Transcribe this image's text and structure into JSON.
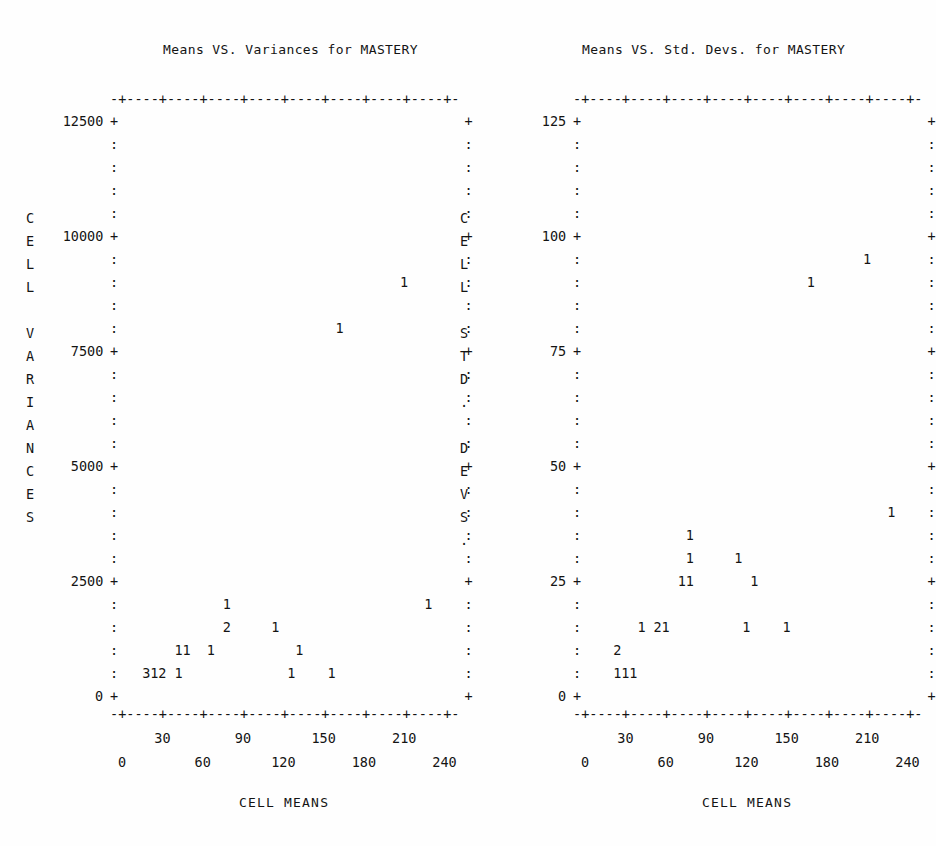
{
  "page": {
    "background": "#fefefe",
    "ink": "#141414",
    "width": 934,
    "height": 846
  },
  "panels": [
    {
      "id": "variances",
      "title": "Means VS. Variances for MASTERY",
      "y_axis_label": "CELL VARIANCES",
      "y_axis_label_chars": [
        "C",
        "E",
        "L",
        "L",
        "",
        "V",
        "A",
        "R",
        "I",
        "A",
        "N",
        "C",
        "E",
        "S"
      ],
      "x_axis_label": "CELL MEANS",
      "y_ticks": [
        "12500",
        "10000",
        "7500",
        "5000",
        "2500",
        "0"
      ],
      "x_ticks_upper": [
        "30",
        "90",
        "150",
        "210"
      ],
      "x_ticks_lower": [
        "0",
        "60",
        "120",
        "180",
        "240"
      ],
      "frame_top": "-+----+----+----+----+----+----+----+----+-",
      "frame_bottom": "-+----+----+----+----+----+----+----+----+-",
      "axis_col_symbol_major": "+",
      "axis_col_symbol_minor": ":"
    },
    {
      "id": "stddevs",
      "title": "Means VS. Std. Devs. for MASTERY",
      "y_axis_label": "CELL STD. DEVS.",
      "y_axis_label_chars": [
        "C",
        "E",
        "L",
        "L",
        "",
        "S",
        "T",
        "D",
        ".",
        "",
        "D",
        "E",
        "V",
        "S",
        "."
      ],
      "x_axis_label": "CELL MEANS",
      "y_ticks": [
        "125",
        "100",
        "75",
        "50",
        "25",
        "0"
      ],
      "x_ticks_upper": [
        "30",
        "90",
        "150",
        "210"
      ],
      "x_ticks_lower": [
        "0",
        "60",
        "120",
        "180",
        "240"
      ],
      "frame_top": "-+----+----+----+----+----+----+----+----+-",
      "frame_bottom": "-+----+----+----+----+----+----+----+----+-",
      "axis_col_symbol_major": "+",
      "axis_col_symbol_minor": ":"
    }
  ],
  "chart_data": [
    {
      "type": "scatter",
      "panel": "variances",
      "title": "Means VS. Variances for MASTERY",
      "xlabel": "CELL MEANS",
      "ylabel": "CELL VARIANCES",
      "xlim": [
        0,
        250
      ],
      "ylim": [
        0,
        12500
      ],
      "xticks": [
        0,
        30,
        60,
        90,
        120,
        150,
        180,
        210,
        240
      ],
      "yticks": [
        0,
        2500,
        5000,
        7500,
        10000,
        12500
      ],
      "grid": false,
      "legend": null,
      "note": "Character-cell stem plot; glyph digit = count of cases at that cell",
      "points": [
        {
          "x": 215,
          "y": 10750,
          "label": "1",
          "count": 1
        },
        {
          "x": 175,
          "y": 9750,
          "label": "1",
          "count": 1
        },
        {
          "x": 75,
          "y": 2250,
          "label": "1",
          "count": 1
        },
        {
          "x": 235,
          "y": 2250,
          "label": "1",
          "count": 1
        },
        {
          "x": 75,
          "y": 1750,
          "label": "2",
          "count": 2
        },
        {
          "x": 110,
          "y": 1750,
          "label": "1",
          "count": 1
        },
        {
          "x": 45,
          "y": 1250,
          "label": "1",
          "count": 1
        },
        {
          "x": 50,
          "y": 1250,
          "label": "1",
          "count": 1
        },
        {
          "x": 70,
          "y": 1250,
          "label": "1",
          "count": 1
        },
        {
          "x": 125,
          "y": 1250,
          "label": "1",
          "count": 1
        },
        {
          "x": 20,
          "y": 250,
          "label": "3",
          "count": 3
        },
        {
          "x": 25,
          "y": 250,
          "label": "1",
          "count": 1
        },
        {
          "x": 30,
          "y": 250,
          "label": "2",
          "count": 2
        },
        {
          "x": 40,
          "y": 250,
          "label": "1",
          "count": 1
        },
        {
          "x": 120,
          "y": 250,
          "label": "1",
          "count": 1
        },
        {
          "x": 150,
          "y": 250,
          "label": "1",
          "count": 1
        }
      ]
    },
    {
      "type": "scatter",
      "panel": "stddevs",
      "title": "Means VS. Std. Devs. for MASTERY",
      "xlabel": "CELL MEANS",
      "ylabel": "CELL STD. DEVS.",
      "xlim": [
        0,
        250
      ],
      "ylim": [
        0,
        125
      ],
      "xticks": [
        0,
        30,
        60,
        90,
        120,
        150,
        180,
        210,
        240
      ],
      "yticks": [
        0,
        25,
        50,
        75,
        100,
        125
      ],
      "grid": false,
      "legend": null,
      "note": "Character-cell stem plot; glyph digit = count of cases at that cell",
      "points": [
        {
          "x": 215,
          "y": 105,
          "label": "1",
          "count": 1
        },
        {
          "x": 175,
          "y": 100,
          "label": "1",
          "count": 1
        },
        {
          "x": 230,
          "y": 47,
          "label": "1",
          "count": 1
        },
        {
          "x": 75,
          "y": 37,
          "label": "1",
          "count": 1
        },
        {
          "x": 75,
          "y": 32,
          "label": "1",
          "count": 1
        },
        {
          "x": 105,
          "y": 32,
          "label": "1",
          "count": 1
        },
        {
          "x": 70,
          "y": 27,
          "label": "1",
          "count": 1
        },
        {
          "x": 75,
          "y": 27,
          "label": "1",
          "count": 1
        },
        {
          "x": 115,
          "y": 27,
          "label": "1",
          "count": 1
        },
        {
          "x": 40,
          "y": 17,
          "label": "1",
          "count": 1
        },
        {
          "x": 55,
          "y": 17,
          "label": "2",
          "count": 2
        },
        {
          "x": 60,
          "y": 17,
          "label": "1",
          "count": 1
        },
        {
          "x": 110,
          "y": 17,
          "label": "1",
          "count": 1
        },
        {
          "x": 140,
          "y": 17,
          "label": "1",
          "count": 1
        },
        {
          "x": 25,
          "y": 12,
          "label": "2",
          "count": 2
        },
        {
          "x": 25,
          "y": 7,
          "label": "1",
          "count": 1
        },
        {
          "x": 30,
          "y": 7,
          "label": "1",
          "count": 1
        },
        {
          "x": 35,
          "y": 7,
          "label": "1",
          "count": 1
        }
      ]
    }
  ],
  "layout": {
    "char_w": 8.06,
    "row_h": 23.0,
    "rows": 26,
    "cols": 44,
    "left_panel": {
      "origin_x": 118,
      "origin_y": 115,
      "axis_y_x": 110,
      "vlabel_x": 26,
      "ylab_right": 103
    },
    "right_panel": {
      "origin_x": 581,
      "origin_y": 115,
      "axis_y_x": 573,
      "vlabel_x": 460,
      "ylab_right": 566
    },
    "frame_top_y": 93,
    "frame_bottom_y": 708,
    "xtick_upper_y": 732,
    "xtick_lower_y": 756,
    "xlabel_y": 795,
    "title_y": 49
  },
  "grids": {
    "variances": [
      {
        "row": 0,
        "text": ""
      },
      {
        "row": 5,
        "text": ""
      },
      {
        "row": 7,
        "cells": [
          {
            "col": 35,
            "ch": "1"
          }
        ]
      },
      {
        "row": 9,
        "cells": [
          {
            "col": 27,
            "ch": "1"
          }
        ]
      },
      {
        "row": 21,
        "cells": [
          {
            "col": 13,
            "ch": "1"
          },
          {
            "col": 38,
            "ch": "1"
          }
        ]
      },
      {
        "row": 22,
        "cells": [
          {
            "col": 13,
            "ch": "2"
          },
          {
            "col": 19,
            "ch": "1"
          }
        ]
      },
      {
        "row": 23,
        "cells": [
          {
            "col": 7,
            "ch": "1"
          },
          {
            "col": 8,
            "ch": "1"
          },
          {
            "col": 11,
            "ch": "1"
          },
          {
            "col": 22,
            "ch": "1"
          }
        ]
      },
      {
        "row": 24,
        "cells": [
          {
            "col": 3,
            "ch": "3"
          },
          {
            "col": 4,
            "ch": "1"
          },
          {
            "col": 5,
            "ch": "2"
          },
          {
            "col": 7,
            "ch": "1"
          },
          {
            "col": 21,
            "ch": "1"
          },
          {
            "col": 26,
            "ch": "1"
          }
        ]
      }
    ],
    "stddevs": [
      {
        "row": 6,
        "cells": [
          {
            "col": 35,
            "ch": "1"
          }
        ]
      },
      {
        "row": 7,
        "cells": [
          {
            "col": 28,
            "ch": "1"
          }
        ]
      },
      {
        "row": 17,
        "cells": [
          {
            "col": 38,
            "ch": "1"
          }
        ]
      },
      {
        "row": 18,
        "cells": [
          {
            "col": 13,
            "ch": "1"
          }
        ]
      },
      {
        "row": 19,
        "cells": [
          {
            "col": 13,
            "ch": "1"
          },
          {
            "col": 19,
            "ch": "1"
          }
        ]
      },
      {
        "row": 20,
        "cells": [
          {
            "col": 12,
            "ch": "1"
          },
          {
            "col": 13,
            "ch": "1"
          },
          {
            "col": 21,
            "ch": "1"
          }
        ]
      },
      {
        "row": 22,
        "cells": [
          {
            "col": 7,
            "ch": "1"
          },
          {
            "col": 9,
            "ch": "2"
          },
          {
            "col": 10,
            "ch": "1"
          },
          {
            "col": 20,
            "ch": "1"
          },
          {
            "col": 25,
            "ch": "1"
          }
        ]
      },
      {
        "row": 23,
        "cells": [
          {
            "col": 4,
            "ch": "2"
          }
        ]
      },
      {
        "row": 24,
        "cells": [
          {
            "col": 4,
            "ch": "1"
          },
          {
            "col": 5,
            "ch": "1"
          },
          {
            "col": 6,
            "ch": "1"
          }
        ]
      }
    ]
  }
}
